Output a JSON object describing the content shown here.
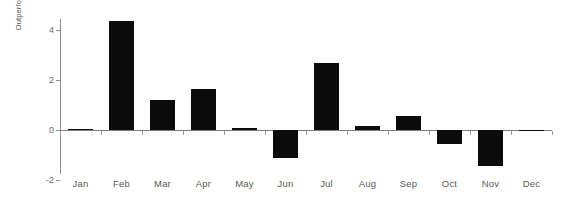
{
  "chart_data": {
    "type": "bar",
    "title": "",
    "subtitle": "",
    "xlabel": "",
    "ylabel": "Outperformance (%)",
    "categories": [
      "Jan",
      "Feb",
      "Mar",
      "Apr",
      "May",
      "Jun",
      "Jul",
      "Aug",
      "Sep",
      "Oct",
      "Nov",
      "Dec"
    ],
    "values": [
      0.05,
      4.35,
      1.2,
      1.65,
      0.1,
      -1.1,
      2.7,
      0.15,
      0.55,
      -0.55,
      -1.45,
      -0.05
    ],
    "yticks": [
      -2,
      0,
      2,
      4
    ],
    "ytick_labels": [
      "-2",
      "0",
      "2",
      "4"
    ],
    "ylim": [
      -2,
      4.8
    ],
    "grid": false,
    "legend": null,
    "bar_color": "#0b0b0b",
    "axis_color": "#8a8b8d",
    "text_color": "#58585a",
    "background": "#ffffff"
  }
}
